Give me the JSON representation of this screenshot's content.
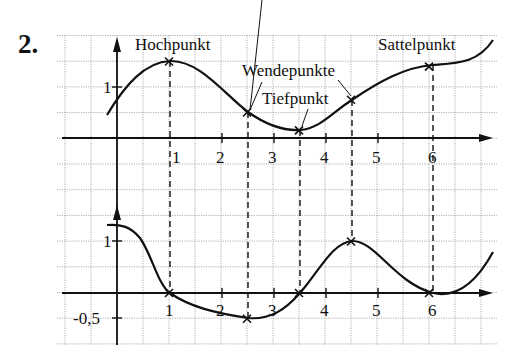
{
  "task": {
    "number": "2."
  },
  "annotations": {
    "hochpunkt": "Hochpunkt",
    "wendepunkte": "Wendepunkte",
    "tiefpunkt": "Tiefpunkt",
    "sattelpunkt": "Sattelpunkt"
  },
  "top_axis": {
    "x_ticks": [
      "1",
      "2",
      "3",
      "4",
      "5",
      "6"
    ],
    "y_ticks": [
      "1"
    ]
  },
  "bottom_axis": {
    "x_ticks": [
      "1",
      "2",
      "3",
      "4",
      "5",
      "6"
    ],
    "y_ticks": [
      "1",
      "-0,5"
    ]
  },
  "chart_data": [
    {
      "type": "line",
      "title": "f(x) — Funktionsgraph",
      "xlabel": "",
      "ylabel": "",
      "xlim": [
        -1.1,
        7.3
      ],
      "ylim": [
        -2.0,
        2.0
      ],
      "grid": true,
      "x": [
        -0.2,
        0,
        0.5,
        1,
        1.5,
        2,
        2.5,
        3,
        3.5,
        4,
        4.5,
        5,
        5.5,
        6,
        6.5,
        7.1
      ],
      "values": [
        0.45,
        0.7,
        1.25,
        1.5,
        1.35,
        0.95,
        0.5,
        0.22,
        0.15,
        0.35,
        0.75,
        1.1,
        1.33,
        1.4,
        1.45,
        1.95
      ],
      "special_points": [
        {
          "label": "Hochpunkt",
          "x": 1,
          "y": 1.5
        },
        {
          "label": "Wendepunkte",
          "x": 2.5,
          "y": 0.5
        },
        {
          "label": "Tiefpunkt",
          "x": 3.5,
          "y": 0.15
        },
        {
          "label": "Wendepunkte",
          "x": 4.5,
          "y": 0.75
        },
        {
          "label": "Sattelpunkt",
          "x": 6,
          "y": 1.4
        }
      ]
    },
    {
      "type": "line",
      "title": "f'(x) — Ableitungsgraph",
      "xlabel": "",
      "ylabel": "",
      "xlim": [
        -1.1,
        7.3
      ],
      "ylim": [
        -1.0,
        1.75
      ],
      "grid": true,
      "x": [
        -0.2,
        0,
        0.5,
        1,
        1.5,
        2,
        2.5,
        3,
        3.5,
        4,
        4.5,
        5,
        5.5,
        6,
        6.5,
        7.1
      ],
      "values": [
        1.3,
        1.28,
        0.85,
        0.0,
        -0.28,
        -0.45,
        -0.5,
        -0.38,
        0.0,
        0.65,
        1.0,
        0.7,
        0.2,
        0.0,
        0.15,
        1.05
      ],
      "special_points": [
        {
          "x": 1,
          "y": 0
        },
        {
          "x": 2.5,
          "y": -0.5
        },
        {
          "x": 3.5,
          "y": 0
        },
        {
          "x": 4.5,
          "y": 1
        },
        {
          "x": 6,
          "y": 0
        }
      ]
    }
  ]
}
